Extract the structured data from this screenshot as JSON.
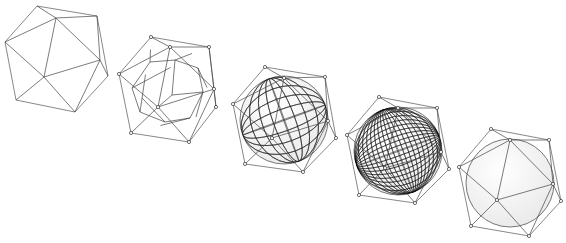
{
  "figure": {
    "title": "",
    "colors": {
      "background": "#ffffff",
      "cage": "#6a6a6a",
      "mesh": "#222222",
      "sphere_fill": "#e9e9e9"
    },
    "stages": [
      {
        "name": "icosahedron",
        "outline": [
          [
            37,
            6
          ],
          [
            97,
            16
          ],
          [
            108,
            76
          ],
          [
            75,
            112
          ],
          [
            16,
            100
          ],
          [
            5,
            42
          ]
        ],
        "inner": [
          [
            56,
            18
          ],
          [
            100,
            60
          ],
          [
            44,
            77
          ]
        ],
        "show_vertices": false,
        "sphere": null
      },
      {
        "name": "subdivision-level-1",
        "outline": [
          [
            151,
            37
          ],
          [
            209,
            47
          ],
          [
            216,
            107
          ],
          [
            189,
            142
          ],
          [
            131,
            133
          ],
          [
            119,
            74
          ]
        ],
        "inner": [
          [
            170,
            47
          ],
          [
            214,
            89
          ],
          [
            158,
            107
          ]
        ],
        "show_vertices": true,
        "sphere": null
      },
      {
        "name": "subdivision-level-2",
        "outline": [
          [
            265,
            67
          ],
          [
            325,
            77
          ],
          [
            336,
            138
          ],
          [
            303,
            172
          ],
          [
            245,
            164
          ],
          [
            233,
            104
          ]
        ],
        "inner": [
          [
            284,
            78
          ],
          [
            328,
            121
          ],
          [
            272,
            138
          ]
        ],
        "show_vertices": true,
        "sphere": {
          "cx": 284,
          "cy": 120,
          "r": 44,
          "lines": 8
        }
      },
      {
        "name": "subdivision-level-3",
        "outline": [
          [
            379,
            97
          ],
          [
            437,
            108
          ],
          [
            449,
            169
          ],
          [
            415,
            203
          ],
          [
            359,
            195
          ],
          [
            347,
            135
          ]
        ],
        "inner": [
          [
            398,
            108
          ],
          [
            441,
            152
          ],
          [
            385,
            168
          ]
        ],
        "show_vertices": true,
        "sphere": {
          "cx": 398,
          "cy": 151,
          "r": 44,
          "lines": 18
        }
      },
      {
        "name": "limit-surface",
        "outline": [
          [
            491,
            129
          ],
          [
            549,
            140
          ],
          [
            561,
            201
          ],
          [
            529,
            236
          ],
          [
            471,
            226
          ],
          [
            459,
            167
          ]
        ],
        "inner": [
          [
            510,
            140
          ],
          [
            553,
            184
          ],
          [
            497,
            200
          ]
        ],
        "show_vertices": true,
        "sphere": {
          "cx": 510,
          "cy": 183,
          "r": 44,
          "lines": 0
        }
      }
    ]
  }
}
